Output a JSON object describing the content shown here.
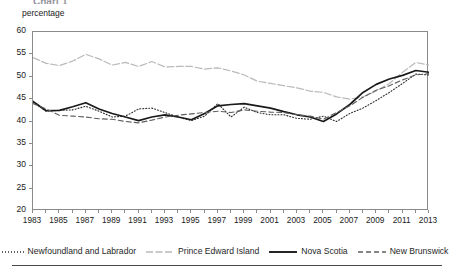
{
  "page": {
    "clipped_title": "Chart 1",
    "y_axis_unit_label": "percentage"
  },
  "legend": {
    "items": [
      {
        "label": "Newfoundland and Labrador",
        "style": "dotted",
        "color": "#2b2b2b",
        "name": "legend-item-newfoundland-and-labrador"
      },
      {
        "label": "Prince Edward Island",
        "style": "dashdot",
        "color": "#b9b9b9",
        "name": "legend-item-prince-edward-island"
      },
      {
        "label": "Nova Scotia",
        "style": "solid",
        "color": "#1a1a1a",
        "name": "legend-item-nova-scotia"
      },
      {
        "label": "New Brunswick",
        "style": "dashed",
        "color": "#5e5e5e",
        "name": "legend-item-new-brunswick"
      }
    ]
  },
  "chart_data": {
    "type": "line",
    "title": "",
    "xlabel": "",
    "ylabel": "percentage",
    "xlim": [
      1983,
      2013
    ],
    "ylim": [
      20,
      60
    ],
    "yticks": [
      20,
      25,
      30,
      35,
      40,
      45,
      50,
      55,
      60
    ],
    "xticks": [
      1983,
      1984,
      1985,
      1986,
      1987,
      1988,
      1989,
      1990,
      1991,
      1992,
      1993,
      1994,
      1995,
      1996,
      1997,
      1998,
      1999,
      2000,
      2001,
      2002,
      2003,
      2004,
      2005,
      2006,
      2007,
      2008,
      2009,
      2010,
      2011,
      2012,
      2013
    ],
    "xtick_labels": [
      "1983",
      "1985",
      "1987",
      "1989",
      "1991",
      "1993",
      "1995",
      "1997",
      "1999",
      "2001",
      "2003",
      "2005",
      "2007",
      "2009",
      "2011",
      "2013"
    ],
    "xtick_label_years": [
      1983,
      1985,
      1987,
      1989,
      1991,
      1993,
      1995,
      1997,
      1999,
      2001,
      2003,
      2005,
      2007,
      2009,
      2011,
      2013
    ],
    "grid": false,
    "legend_position": "bottom",
    "x": [
      1983,
      1984,
      1985,
      1986,
      1987,
      1988,
      1989,
      1990,
      1991,
      1992,
      1993,
      1994,
      1995,
      1996,
      1997,
      1998,
      1999,
      2000,
      2001,
      2002,
      2003,
      2004,
      2005,
      2006,
      2007,
      2008,
      2009,
      2010,
      2011,
      2012,
      2013
    ],
    "series": [
      {
        "name": "Newfoundland and Labrador",
        "style": "dotted",
        "color": "#2b2b2b",
        "values": [
          44.3,
          42.3,
          42.5,
          42.6,
          43.4,
          42.3,
          41.0,
          41.2,
          42.8,
          43.0,
          42.0,
          41.0,
          40.2,
          41.2,
          44.0,
          41.0,
          43.2,
          42.0,
          41.5,
          41.5,
          40.7,
          40.5,
          41.2,
          40.0,
          41.8,
          43.0,
          44.7,
          46.5,
          48.5,
          50.6,
          50.4
        ]
      },
      {
        "name": "Prince Edward Island",
        "style": "dashdot",
        "color": "#b9b9b9",
        "values": [
          54.3,
          53.0,
          52.5,
          53.5,
          55.0,
          54.0,
          52.6,
          53.2,
          52.3,
          53.4,
          52.2,
          52.3,
          52.3,
          51.7,
          52.0,
          51.3,
          50.4,
          49.0,
          48.5,
          48.0,
          47.5,
          46.8,
          46.5,
          45.5,
          45.0,
          45.5,
          46.8,
          48.5,
          51.0,
          53.2,
          52.6
        ]
      },
      {
        "name": "Nova Scotia",
        "style": "solid",
        "color": "#1a1a1a",
        "values": [
          44.5,
          42.4,
          42.5,
          43.3,
          44.2,
          42.8,
          41.8,
          41.0,
          40.2,
          41.0,
          41.5,
          41.0,
          40.4,
          41.8,
          43.5,
          43.8,
          44.0,
          43.5,
          43.0,
          42.2,
          41.5,
          41.0,
          40.0,
          41.7,
          43.8,
          46.5,
          48.3,
          49.5,
          50.3,
          51.4,
          51.0
        ]
      },
      {
        "name": "New Brunswick",
        "style": "dashed",
        "color": "#5e5e5e",
        "values": [
          44.0,
          42.8,
          41.4,
          41.2,
          41.0,
          40.6,
          40.5,
          40.0,
          39.7,
          40.3,
          41.0,
          41.4,
          41.7,
          42.0,
          42.3,
          42.0,
          42.6,
          42.3,
          42.1,
          42.0,
          41.5,
          41.2,
          40.5,
          42.0,
          43.5,
          45.4,
          47.0,
          48.0,
          49.3,
          50.4,
          50.7
        ]
      }
    ]
  }
}
